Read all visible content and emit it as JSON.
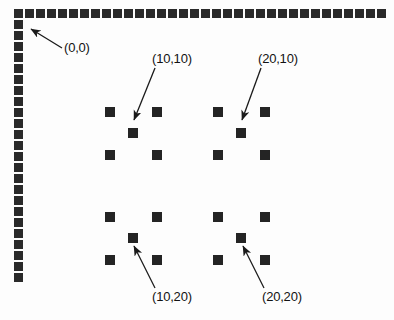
{
  "figure": {
    "background_color": "#fdfdfd",
    "marker_color": "#242424",
    "border_color": "#2a2a2a",
    "text_color": "#121212"
  },
  "border": {
    "name": "dotted-frame",
    "square_size": 9,
    "pitch": 11,
    "top_row": {
      "start_x": 14,
      "y": 9,
      "count": 34
    },
    "left_column": {
      "x": 14,
      "start_y": 20,
      "count": 24
    }
  },
  "clusters": [
    {
      "id": "cluster-10-10",
      "label": "(10,10)",
      "label_x": 152,
      "label_y": 52,
      "arrow_from_x": 155,
      "arrow_from_y": 68,
      "arrow_to_x": 134,
      "arrow_to_y": 120,
      "left_x": 105,
      "right_x": 152,
      "top_y": 107,
      "bottom_y": 150,
      "center_x": 128,
      "center_y": 128
    },
    {
      "id": "cluster-20-10",
      "label": "(20,10)",
      "label_x": 258,
      "label_y": 52,
      "arrow_from_x": 261,
      "arrow_from_y": 68,
      "arrow_to_x": 242,
      "arrow_to_y": 120,
      "left_x": 213,
      "right_x": 260,
      "top_y": 107,
      "bottom_y": 150,
      "center_x": 236,
      "center_y": 128
    },
    {
      "id": "cluster-10-20",
      "label": "(10,20)",
      "label_x": 152,
      "label_y": 290,
      "arrow_from_x": 155,
      "arrow_from_y": 288,
      "arrow_to_x": 134,
      "arrow_to_y": 246,
      "left_x": 105,
      "right_x": 152,
      "top_y": 212,
      "bottom_y": 255,
      "center_x": 128,
      "center_y": 233
    },
    {
      "id": "cluster-20-20",
      "label": "(20,20)",
      "label_x": 262,
      "label_y": 290,
      "arrow_from_x": 264,
      "arrow_from_y": 288,
      "arrow_to_x": 243,
      "arrow_to_y": 246,
      "left_x": 213,
      "right_x": 260,
      "top_y": 212,
      "bottom_y": 255,
      "center_x": 236,
      "center_y": 233
    }
  ],
  "origin": {
    "id": "origin-annotation",
    "label": "(0,0)",
    "label_x": 64,
    "label_y": 41,
    "arrow_from_x": 62,
    "arrow_from_y": 48,
    "arrow_to_x": 31,
    "arrow_to_y": 29
  },
  "marker_size": 10
}
